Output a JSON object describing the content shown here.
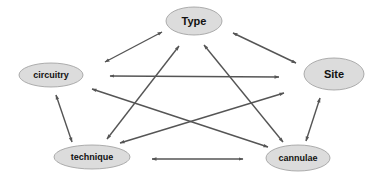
{
  "diagram": {
    "type": "relationship-graph",
    "colors": {
      "node_fill": "#dcdcdc",
      "node_stroke": "#9a9a9a",
      "edge": "#555555",
      "text": "#111111",
      "background": "#ffffff"
    },
    "nodes": [
      {
        "id": "type",
        "label": "Type",
        "cx": 194,
        "cy": 21,
        "rx": 28,
        "ry": 14,
        "font_size": 11
      },
      {
        "id": "circuitry",
        "label": "circuitry",
        "cx": 51,
        "cy": 75,
        "rx": 32,
        "ry": 12,
        "font_size": 9
      },
      {
        "id": "site",
        "label": "Site",
        "cx": 334,
        "cy": 74,
        "rx": 30,
        "ry": 16,
        "font_size": 11
      },
      {
        "id": "technique",
        "label": "technique",
        "cx": 92,
        "cy": 157,
        "rx": 38,
        "ry": 12,
        "font_size": 9
      },
      {
        "id": "cannulae",
        "label": "cannulae",
        "cx": 298,
        "cy": 158,
        "rx": 32,
        "ry": 13,
        "font_size": 9
      }
    ],
    "edges": [
      {
        "from": "circuitry",
        "to": "type",
        "x1": 105,
        "y1": 62,
        "x2": 162,
        "y2": 32,
        "bidirectional": true
      },
      {
        "from": "type",
        "to": "site",
        "x1": 233,
        "y1": 33,
        "x2": 296,
        "y2": 63,
        "bidirectional": true
      },
      {
        "from": "circuitry",
        "to": "site",
        "x1": 110,
        "y1": 76,
        "x2": 279,
        "y2": 77,
        "bidirectional": true
      },
      {
        "from": "circuitry",
        "to": "technique",
        "x1": 56,
        "y1": 95,
        "x2": 72,
        "y2": 142,
        "bidirectional": true
      },
      {
        "from": "site",
        "to": "cannulae",
        "x1": 320,
        "y1": 98,
        "x2": 306,
        "y2": 141,
        "bidirectional": true
      },
      {
        "from": "technique",
        "to": "cannulae",
        "x1": 152,
        "y1": 159,
        "x2": 243,
        "y2": 159,
        "bidirectional": true
      },
      {
        "from": "type",
        "to": "technique",
        "x1": 179,
        "y1": 46,
        "x2": 107,
        "y2": 139,
        "bidirectional": true
      },
      {
        "from": "type",
        "to": "cannulae",
        "x1": 204,
        "y1": 45,
        "x2": 283,
        "y2": 142,
        "bidirectional": true
      },
      {
        "from": "circuitry",
        "to": "cannulae",
        "x1": 92,
        "y1": 89,
        "x2": 268,
        "y2": 147,
        "bidirectional": true
      },
      {
        "from": "technique",
        "to": "site",
        "x1": 120,
        "y1": 143,
        "x2": 284,
        "y2": 93,
        "bidirectional": true
      }
    ]
  }
}
